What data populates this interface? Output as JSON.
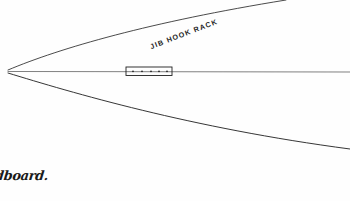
{
  "sheet": {
    "width": 350,
    "height": 201,
    "background_color": "#fefefe",
    "ink_color": "#2b2b2b",
    "medium": "pen-on-paper-sketch"
  },
  "annotations": {
    "jib_hook_rack_label": "JIB HOOK RACK",
    "bottom_caption": "ndboard."
  },
  "diagram": {
    "vertex_x": 8,
    "vertex_y": 70,
    "upper_curve_path": "M 8 70 C 60 48, 150 22, 286 0",
    "centerline_path": "M 8 71.5 L 350 72",
    "lower_curve_path": "M 8 73 C 70 92, 190 128, 350 149",
    "rack_box": {
      "x": 126,
      "y": 67,
      "width": 46,
      "height": 8.5,
      "dot_count": 5,
      "dot_radius": 0.85,
      "dot_x_positions": [
        133,
        142,
        151,
        159,
        167
      ],
      "dot_y": 71.3
    },
    "stroke_widths": {
      "upper_curve": 0.85,
      "centerline": 0.6,
      "lower_curve": 0.95
    }
  }
}
